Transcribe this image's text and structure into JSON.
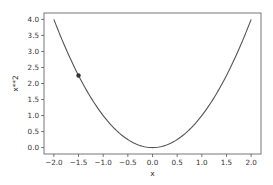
{
  "chart_data": {
    "type": "line",
    "title": "",
    "xlabel": "x",
    "ylabel": "x**2",
    "xlim": [
      -2.2,
      2.2
    ],
    "ylim": [
      -0.2,
      4.2
    ],
    "grid": false,
    "legend": null,
    "x_ticks": [
      -2.0,
      -1.5,
      -1.0,
      -0.5,
      0.0,
      0.5,
      1.0,
      1.5,
      2.0
    ],
    "x_tick_labels": [
      "−2.0",
      "−1.5",
      "−1.0",
      "−0.5",
      "0.0",
      "0.5",
      "1.0",
      "1.5",
      "2.0"
    ],
    "y_ticks": [
      0.0,
      0.5,
      1.0,
      1.5,
      2.0,
      2.5,
      3.0,
      3.5,
      4.0
    ],
    "y_tick_labels": [
      "0.0",
      "0.5",
      "1.0",
      "1.5",
      "2.0",
      "2.5",
      "3.0",
      "3.5",
      "4.0"
    ],
    "series": [
      {
        "name": "y = x**2",
        "function": "x**2",
        "x_range": [
          -2.0,
          2.0
        ],
        "x": [
          -2.0,
          -1.5,
          -1.0,
          -0.5,
          0.0,
          0.5,
          1.0,
          1.5,
          2.0
        ],
        "y": [
          4.0,
          2.25,
          1.0,
          0.25,
          0.0,
          0.25,
          1.0,
          2.25,
          4.0
        ],
        "color": "#555555"
      }
    ],
    "markers": [
      {
        "x": -1.5,
        "y": 2.25,
        "color": "#333333"
      }
    ]
  },
  "style": {
    "line_color": "#555555",
    "marker_color": "#333333",
    "axis_color": "#555555",
    "text_color": "#333333"
  }
}
